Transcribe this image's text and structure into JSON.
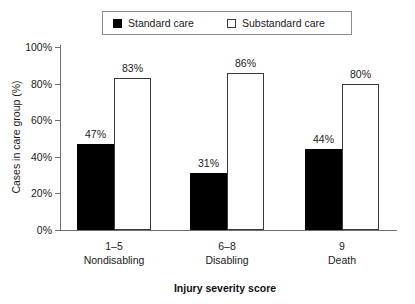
{
  "chart_data": {
    "type": "bar",
    "title": "",
    "xlabel": "Injury severity score",
    "ylabel": "Cases in care group (%)",
    "categories": [
      "1–5",
      "6–8",
      "9"
    ],
    "category_sublabels": [
      "Nondisabling",
      "Disabling",
      "Death"
    ],
    "series": [
      {
        "name": "Standard care",
        "values": [
          47,
          31,
          44
        ],
        "labels": [
          "47%",
          "31%",
          "44%"
        ],
        "color": "#000000",
        "style": "filled"
      },
      {
        "name": "Substandard care",
        "values": [
          83,
          86,
          80
        ],
        "labels": [
          "83%",
          "86%",
          "80%"
        ],
        "color": "#ffffff",
        "style": "outlined"
      }
    ],
    "ylim": [
      0,
      100
    ],
    "yticks": [
      0,
      20,
      40,
      60,
      80,
      100
    ],
    "ytick_labels": [
      "0%",
      "20%",
      "40%",
      "60%",
      "80%",
      "100%"
    ],
    "grid": false,
    "legend_position": "top"
  },
  "legend": {
    "entries": [
      {
        "label": "Standard care",
        "swatch": "filled-square-icon"
      },
      {
        "label": "Substandard care",
        "swatch": "hollow-square-icon"
      }
    ]
  },
  "axes": {
    "y_title": "Cases in care group (%)",
    "x_title": "Injury severity score"
  }
}
